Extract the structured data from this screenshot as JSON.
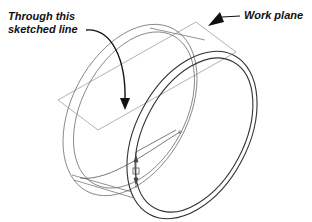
{
  "callouts": {
    "sketched_line": [
      "Through this",
      "sketched line"
    ],
    "work_plane": "Work plane"
  },
  "colors": {
    "ink": "#111111",
    "thin_line": "#777777",
    "plane_line": "#9a9a9a",
    "background": "#ffffff"
  }
}
